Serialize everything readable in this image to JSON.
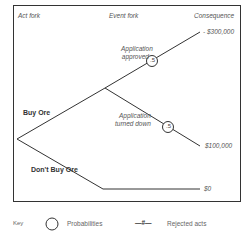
{
  "header": {
    "act_fork": "Act fork",
    "event_fork": "Event fork",
    "consequence": "Consequence"
  },
  "acts": {
    "buy": "Buy Ore",
    "dont_buy": "Don't Buy Ore"
  },
  "events": {
    "approved": {
      "line1": "Application",
      "line2": "approved",
      "prob": ".5"
    },
    "turned_down": {
      "line1": "Application",
      "line2": "turned down",
      "prob": ".5"
    }
  },
  "consequences": {
    "approved": "- $300,000",
    "turned_down": "$100,000",
    "dont_buy": "$0"
  },
  "key": {
    "label": "Key",
    "probabilities": "Probabilities",
    "rejected_symbol": "—#—",
    "rejected": "Rejected acts"
  }
}
